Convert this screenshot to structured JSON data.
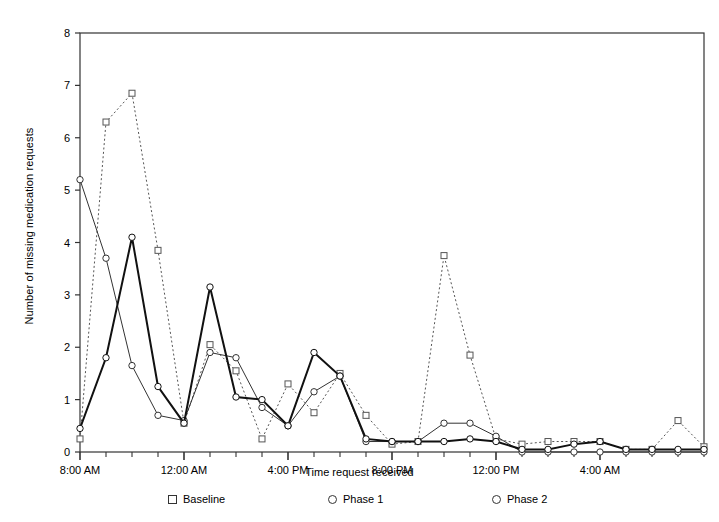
{
  "chart_data": {
    "type": "line",
    "title": "",
    "xlabel": "Time request received",
    "ylabel": "Number of missing medication requests",
    "ylim": [
      0,
      8
    ],
    "yticks": [
      0,
      1,
      2,
      3,
      4,
      5,
      6,
      7,
      8
    ],
    "grid": false,
    "legend_position": "bottom",
    "x_tick_labels": [
      "8:00 AM",
      "12:00 AM",
      "4:00 PM",
      "8:00 PM",
      "12:00 PM",
      "4:00 AM"
    ],
    "x_major_tick_indices": [
      0,
      4,
      8,
      12,
      16,
      20
    ],
    "x_minor_tick_count": 25,
    "n_points": 25,
    "series": [
      {
        "name": "Baseline",
        "marker": "square",
        "line_style": "dotted",
        "color": "#555555",
        "values": [
          0.25,
          6.3,
          6.85,
          3.85,
          0.55,
          2.05,
          1.55,
          0.25,
          1.3,
          0.75,
          1.5,
          0.7,
          0.15,
          0.2,
          3.75,
          1.85,
          0.25,
          0.15,
          0.2,
          0.2,
          0.2,
          0.05,
          0.05,
          0.6,
          0.1
        ]
      },
      {
        "name": "Phase 1",
        "marker": "circle",
        "line_style": "solid-thin",
        "color": "#333333",
        "values": [
          5.2,
          3.7,
          1.65,
          0.7,
          0.6,
          1.9,
          1.8,
          0.85,
          0.5,
          1.15,
          1.45,
          0.2,
          0.2,
          0.2,
          0.55,
          0.55,
          0.3,
          0.0,
          0.0,
          0.0,
          0.0,
          0.0,
          0.0,
          0.0,
          0.0
        ]
      },
      {
        "name": "Phase 2",
        "marker": "circle",
        "line_style": "solid-thick",
        "color": "#111111",
        "values": [
          0.45,
          1.8,
          4.1,
          1.25,
          0.55,
          3.15,
          1.05,
          1.0,
          0.5,
          1.9,
          1.45,
          0.25,
          0.2,
          0.2,
          0.2,
          0.25,
          0.2,
          0.05,
          0.05,
          0.15,
          0.2,
          0.05,
          0.05,
          0.05,
          0.05
        ]
      }
    ]
  },
  "legend": {
    "items": [
      {
        "label": "Baseline",
        "marker": "square-marker"
      },
      {
        "label": "Phase 1",
        "marker": "circle-marker"
      },
      {
        "label": "Phase 2",
        "marker": "circle-marker"
      }
    ]
  },
  "colors": {
    "axis": "#333333",
    "background": "#ffffff",
    "baseline": "#555555",
    "phase1": "#333333",
    "phase2": "#111111"
  }
}
